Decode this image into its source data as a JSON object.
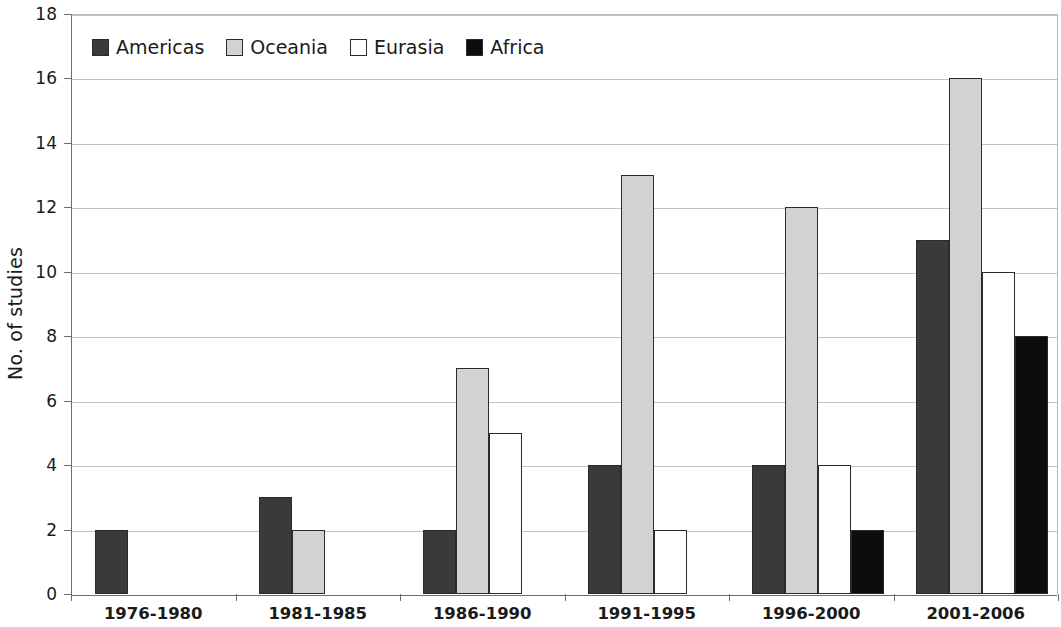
{
  "chart_data": {
    "type": "bar",
    "title": "",
    "subtitle": "",
    "xlabel": "",
    "ylabel": "No. of studies",
    "categories": [
      "1976-1980",
      "1981-1985",
      "1986-1990",
      "1991-1995",
      "1996-2000",
      "2001-2006"
    ],
    "series": [
      {
        "name": "Americas",
        "color": "#3a3a3a",
        "values": [
          2,
          3,
          2,
          4,
          4,
          11
        ]
      },
      {
        "name": "Oceania",
        "color": "#d2d2d2",
        "values": [
          0,
          2,
          7,
          13,
          12,
          16
        ]
      },
      {
        "name": "Eurasia",
        "color": "#ffffff",
        "values": [
          0,
          0,
          5,
          2,
          4,
          10
        ]
      },
      {
        "name": "Africa",
        "color": "#0d0d0d",
        "values": [
          0,
          0,
          0,
          0,
          2,
          8
        ]
      }
    ],
    "ylim": [
      0,
      18
    ],
    "ytick_labels": [
      "18",
      "16",
      "14",
      "12",
      "10",
      "8",
      "6",
      "4",
      "2",
      "0"
    ],
    "ytick_values": [
      18,
      16,
      14,
      12,
      10,
      8,
      6,
      4,
      2,
      0
    ],
    "grid": true,
    "grid_axis": "y",
    "legend_position": "top-left",
    "legend": [
      "Americas",
      "Oceania",
      "Eurasia",
      "Africa"
    ],
    "bar_border_color": "#2b2b2b",
    "axis_color": "#6e6e6e",
    "gridline_color": "#c3c3c3",
    "background": "#ffffff"
  }
}
